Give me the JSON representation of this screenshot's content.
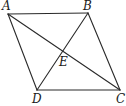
{
  "diagram": {
    "type": "geometry",
    "shape": "parallelogram",
    "stroke_color": "#2a2a2a",
    "points": {
      "A": {
        "label": "A",
        "x": 8,
        "y": 14
      },
      "B": {
        "label": "B",
        "x": 88,
        "y": 13
      },
      "C": {
        "label": "C",
        "x": 120,
        "y": 90
      },
      "D": {
        "label": "D",
        "x": 37,
        "y": 90
      },
      "E": {
        "label": "E",
        "x": 63,
        "y": 51
      }
    },
    "segments": [
      {
        "from": "A",
        "to": "B"
      },
      {
        "from": "B",
        "to": "C"
      },
      {
        "from": "C",
        "to": "D"
      },
      {
        "from": "D",
        "to": "A"
      },
      {
        "from": "A",
        "to": "C"
      },
      {
        "from": "B",
        "to": "D"
      }
    ],
    "labels": [
      {
        "id": "A",
        "text": "A",
        "left": 2,
        "top": 0
      },
      {
        "id": "B",
        "text": "B",
        "left": 83,
        "top": 0
      },
      {
        "id": "E",
        "text": "E",
        "left": 59,
        "top": 56
      },
      {
        "id": "D",
        "text": "D",
        "left": 32,
        "top": 93
      },
      {
        "id": "C",
        "text": "C",
        "left": 116,
        "top": 93
      }
    ]
  }
}
